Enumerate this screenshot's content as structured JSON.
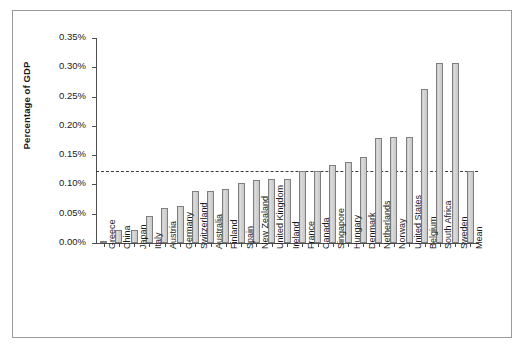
{
  "chart_data": {
    "type": "bar",
    "title": "",
    "xlabel": "",
    "ylabel": "Percentage of GDP",
    "ylim": [
      0,
      0.0035
    ],
    "ytick_labels": [
      "0.00%",
      "0.05%",
      "0.10%",
      "0.15%",
      "0.20%",
      "0.25%",
      "0.30%",
      "0.35%"
    ],
    "ytick_values": [
      0.0,
      0.0005,
      0.001,
      0.0015,
      0.002,
      0.0025,
      0.003,
      0.0035
    ],
    "grid": false,
    "legend": false,
    "units": "percent of GDP",
    "categories": [
      "Greece",
      "China",
      "Japan",
      "Italy",
      "Austria",
      "Germany",
      "Switzerland",
      "Australia",
      "Finland",
      "Spain",
      "New Zealand",
      "United Kingdom",
      "Ireland",
      "France",
      "Canada",
      "Singapore",
      "Hungary",
      "Denmark",
      "Netherlands",
      "Norway",
      "United States",
      "Belgium",
      "South Africa",
      "Sweden",
      "Mean"
    ],
    "values": [
      0.004,
      0.022,
      0.023,
      0.046,
      0.059,
      0.063,
      0.089,
      0.089,
      0.093,
      0.103,
      0.108,
      0.11,
      0.11,
      0.1225,
      0.1225,
      0.133,
      0.139,
      0.147,
      0.18,
      0.181,
      0.181,
      0.263,
      0.307,
      0.307,
      0.1225
    ],
    "value_labels": [
      "0.004%",
      "0.022%",
      "0.023%",
      "0.046%",
      "0.059%",
      "0.063%",
      "0.089%",
      "0.089%",
      "0.093%",
      "0.103%",
      "0.108%",
      "0.110%",
      "0.110%",
      "0.123%",
      "0.123%",
      "0.133%",
      "0.139%",
      "0.147%",
      "0.180%",
      "0.181%",
      "0.181%",
      "0.263%",
      "0.307%",
      "0.307%",
      "0.123%"
    ],
    "annotations": [
      {
        "name": "mean-reference-line",
        "type": "hline",
        "value": 0.1225,
        "style": "dashed",
        "label": ""
      }
    ],
    "colors": {
      "bar_fill": "#d2d2d2",
      "bar_edge": "#7f7f7f",
      "axis": "#4d4d4d",
      "text": "#1a1a1a",
      "frame": "#9a9a9a",
      "mean_line": "#3b3b3b",
      "background": "#ffffff"
    }
  }
}
